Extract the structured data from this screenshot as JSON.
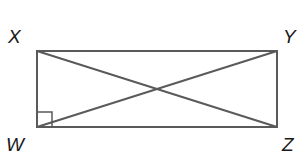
{
  "figure": {
    "type": "rectangle-with-diagonals",
    "stroke_color": "#5a5a5a",
    "vertices": {
      "X": {
        "label": "X",
        "x": 37,
        "y": 51
      },
      "Y": {
        "label": "Y",
        "x": 277,
        "y": 51
      },
      "Z": {
        "label": "Z",
        "x": 277,
        "y": 127
      },
      "W": {
        "label": "W",
        "x": 37,
        "y": 127
      }
    },
    "right_angle_marker": {
      "at": "W",
      "size": 15
    },
    "diagonals": [
      "XZ",
      "WY"
    ]
  }
}
